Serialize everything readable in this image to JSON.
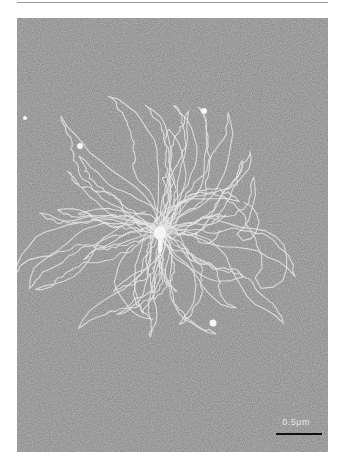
{
  "figure": {
    "type": "electron-micrograph",
    "scale_bar": {
      "label": "0.5μm"
    },
    "colors": {
      "background": "#8a8a8a",
      "dna_strand": "#e6e6e6",
      "capsid": "#f4f4f4",
      "frame": "#ffffff"
    }
  }
}
